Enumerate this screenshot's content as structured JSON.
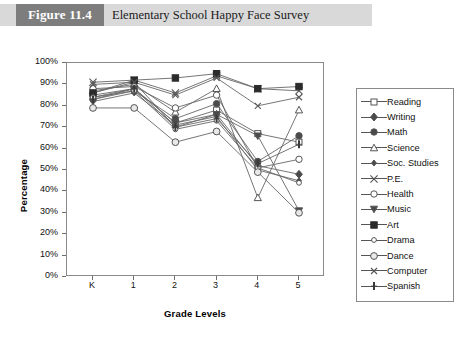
{
  "figure": {
    "badge": "Figure 11.4",
    "title": "Elementary School Happy Face Survey"
  },
  "chart_data": {
    "type": "line",
    "title": "Elementary School Happy Face Survey",
    "xlabel": "Grade Levels",
    "ylabel": "Percentage",
    "categories": [
      "K",
      "1",
      "2",
      "3",
      "4",
      "5"
    ],
    "ylim": [
      0,
      100
    ],
    "yticks": [
      "0%",
      "10%",
      "20%",
      "30%",
      "40%",
      "50%",
      "60%",
      "70%",
      "80%",
      "90%",
      "100%"
    ],
    "grid": false,
    "legend_position": "right",
    "series": [
      {
        "name": "Reading",
        "marker": "open-square",
        "values": [
          84,
          88,
          72,
          78,
          67,
          63
        ]
      },
      {
        "name": "Writing",
        "marker": "filled-diamond",
        "values": [
          86,
          91,
          70,
          76,
          52,
          48
        ]
      },
      {
        "name": "Math",
        "marker": "filled-circle",
        "values": [
          83,
          87,
          74,
          81,
          54,
          66
        ]
      },
      {
        "name": "Science",
        "marker": "open-triangle",
        "values": [
          87,
          90,
          77,
          88,
          37,
          78
        ]
      },
      {
        "name": "Soc. Studies",
        "marker": "small-diamond",
        "values": [
          82,
          86,
          71,
          75,
          50,
          45
        ]
      },
      {
        "name": "P.E.",
        "marker": "cross-x",
        "values": [
          91,
          92,
          86,
          94,
          88,
          87
        ]
      },
      {
        "name": "Health",
        "marker": "open-circle",
        "values": [
          88,
          89,
          79,
          85,
          51,
          55
        ]
      },
      {
        "name": "Music",
        "marker": "filled-triangle",
        "values": [
          85,
          88,
          72,
          76,
          66,
          31
        ]
      },
      {
        "name": "Art",
        "marker": "filled-square",
        "values": [
          86,
          92,
          93,
          95,
          88,
          89
        ]
      },
      {
        "name": "Drama",
        "marker": "small-circle",
        "values": [
          84,
          87,
          69,
          73,
          51,
          44
        ]
      },
      {
        "name": "Dance",
        "marker": "open-circle-2",
        "values": [
          79,
          79,
          63,
          68,
          49,
          30
        ]
      },
      {
        "name": "Computer",
        "marker": "cross-small",
        "values": [
          90,
          91,
          85,
          93,
          80,
          84
        ]
      },
      {
        "name": "Spanish",
        "marker": "vertical-bar",
        "values": [
          83,
          88,
          70,
          74,
          53,
          62
        ]
      }
    ]
  }
}
